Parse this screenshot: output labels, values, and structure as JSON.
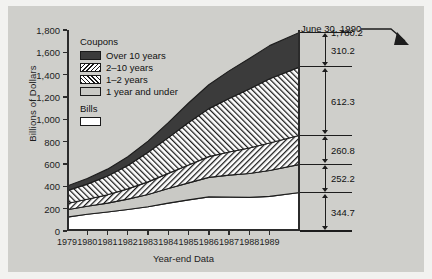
{
  "chart_data": {
    "type": "area",
    "stacked": true,
    "title": "",
    "xlabel": "Year-end Data",
    "ylabel": "Billions of Dollars",
    "ylim": [
      0,
      1800
    ],
    "yticks": [
      "0",
      "200",
      "400",
      "600",
      "800",
      "1,000",
      "1,200",
      "1,400",
      "1,600",
      "1,800"
    ],
    "ytick_values": [
      0,
      200,
      400,
      600,
      800,
      1000,
      1200,
      1400,
      1600,
      1800
    ],
    "grid": false,
    "legend_position": "upper-left-inside",
    "categories": [
      "1979",
      "1980",
      "1981",
      "1982",
      "1983",
      "1984",
      "1985",
      "1986",
      "1987",
      "1988",
      "1989",
      "1990-06-30"
    ],
    "x": [
      1979,
      1980,
      1981,
      1982,
      1983,
      1984,
      1985,
      1986,
      1987,
      1988,
      1989,
      1990.5
    ],
    "series": [
      {
        "name": "Bills",
        "pattern": "solid-white",
        "color": "#ffffff",
        "values": [
          124.0,
          150.0,
          170.0,
          193.0,
          217.0,
          250.0,
          279.0,
          305.0,
          304.0,
          301.0,
          310.0,
          344.7
        ]
      },
      {
        "name": "1 year and under",
        "pattern": "solid-lightgray",
        "color": "#c9c9c5",
        "values": [
          66.0,
          72.0,
          80.0,
          92.0,
          110.0,
          130.0,
          152.0,
          175.0,
          196.0,
          214.0,
          232.0,
          252.2
        ]
      },
      {
        "name": "1–2 years",
        "pattern": "hatch-forward-slash",
        "color": "#ffffff",
        "values": [
          56.0,
          62.0,
          74.0,
          92.0,
          113.0,
          136.0,
          160.0,
          186.0,
          208.0,
          228.0,
          246.0,
          260.8
        ]
      },
      {
        "name": "2–10 years",
        "pattern": "hatch-back-slash",
        "color": "#ffffff",
        "values": [
          116.0,
          136.0,
          168.0,
          210.0,
          265.0,
          320.0,
          380.0,
          430.0,
          478.0,
          528.0,
          576.0,
          612.3
        ]
      },
      {
        "name": "Over 10 years",
        "pattern": "solid-dark",
        "color": "#3b3b3b",
        "values": [
          41.0,
          50.0,
          62.0,
          78.0,
          100.0,
          134.0,
          175.0,
          214.0,
          248.0,
          274.0,
          296.0,
          310.2
        ]
      }
    ],
    "totals": [
      403.0,
      470.0,
      554.0,
      665.0,
      805.0,
      970.0,
      1146.0,
      1310.0,
      1434.0,
      1545.0,
      1660.0,
      1780.2
    ],
    "annotations": [
      {
        "name": "endpoint-callout",
        "text": "June 30, 1990",
        "points_to": "1,780.2"
      }
    ],
    "final_breakdown": {
      "total_label": "1,780.2",
      "segments": [
        {
          "label": "310.2",
          "series": "Over 10 years"
        },
        {
          "label": "612.3",
          "series": "2–10 years"
        },
        {
          "label": "260.8",
          "series": "1–2 years"
        },
        {
          "label": "252.2",
          "series": "1 year and under"
        },
        {
          "label": "344.7",
          "series": "Bills"
        }
      ]
    }
  },
  "legend": {
    "coupons_title": "Coupons",
    "bills_title": "Bills",
    "items": [
      {
        "label": "Over 10 years"
      },
      {
        "label": "2–10 years"
      },
      {
        "label": "1–2 years"
      },
      {
        "label": "1 year and under"
      }
    ],
    "bills_item": {
      "label": ""
    }
  },
  "colors": {
    "figure_background": "#cfcfcb",
    "page_background": "#f2f2f0",
    "ink": "#1d1d1d",
    "over10": "#3b3b3b",
    "under1": "#c9c9c5",
    "bills": "#ffffff"
  }
}
